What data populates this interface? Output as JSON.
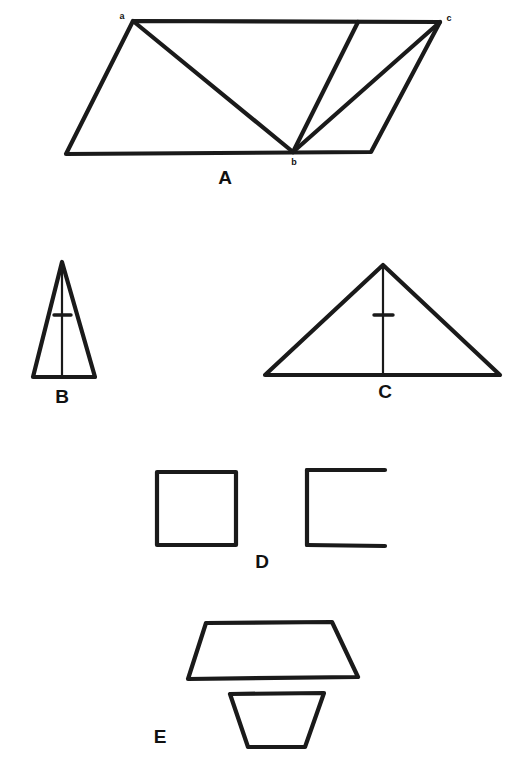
{
  "page": {
    "background_color": "#ffffff",
    "ink_color": "#1a1a1a",
    "width": 529,
    "height": 784
  },
  "panels": [
    {
      "id": "A",
      "label": "A",
      "label_x": 225,
      "label_y": 179,
      "description": "Parallelogram subdivided by three cevians from vertex b",
      "vertex_labels": [
        {
          "text": "a",
          "x": 122,
          "y": 17
        },
        {
          "text": "c",
          "x": 449,
          "y": 19
        },
        {
          "text": "b",
          "x": 294,
          "y": 163
        }
      ]
    },
    {
      "id": "B",
      "label": "B",
      "label_x": 62,
      "label_y": 398,
      "description": "Tall narrow isosceles triangle with altitude and tick mark"
    },
    {
      "id": "C",
      "label": "C",
      "label_x": 385,
      "label_y": 393,
      "description": "Wide isosceles triangle with altitude and tick mark"
    },
    {
      "id": "D",
      "label": "D",
      "label_x": 262,
      "label_y": 563,
      "description": "Closed square beside an open square missing its right side"
    },
    {
      "id": "E",
      "label": "E",
      "label_x": 160,
      "label_y": 738,
      "description": "Large trapezoid above a smaller inverted trapezoid"
    }
  ],
  "shapes": {
    "parallelogram_A": {
      "outline": "133,21 440,22 371,152 66,154",
      "cevian_a_to_b": "133,21 293,152",
      "cevian_b_to_top": "293,152 358,22",
      "cevian_b_to_c": "293,152 440,22"
    },
    "triangle_B": {
      "outline": "62,262 95,377 33,377",
      "altitude": "62,264 62,377",
      "tick": "54,315 71,315"
    },
    "triangle_C": {
      "outline": "383,265 500,375 265,375",
      "altitude": "383,267 383,375",
      "tick": "374,315 393,315"
    },
    "square_closed_D": {
      "outline": "157,472 236,472 236,545 157,545"
    },
    "square_open_D": {
      "top": "385,470 307,470",
      "left": "307,470 307,545",
      "bottom": "307,545 385,546"
    },
    "trapezoid_large_E": {
      "outline": "206,623 332,622 358,677 188,679"
    },
    "trapezoid_small_E": {
      "outline": "230,694 324,693 305,747 248,747"
    }
  }
}
